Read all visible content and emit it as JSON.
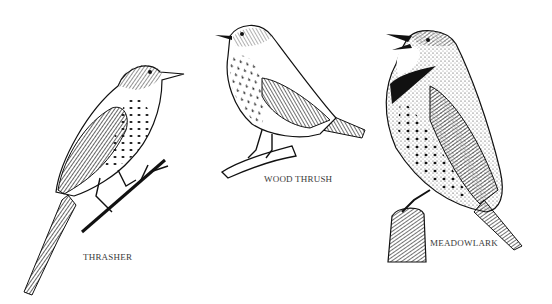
{
  "illustration": {
    "style": "black-and-white pen-and-ink engraving",
    "background": "#ffffff",
    "ink_color": "#111111",
    "birds": [
      {
        "name": "thrasher",
        "label": "THRASHER",
        "perch": "thin twig"
      },
      {
        "name": "wood-thrush",
        "label": "WOOD THRUSH",
        "perch": "branch"
      },
      {
        "name": "meadowlark",
        "label": "MEADOWLARK",
        "perch": "fence post"
      }
    ]
  }
}
